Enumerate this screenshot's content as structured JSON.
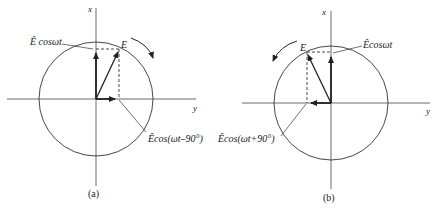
{
  "diagram_a": {
    "axis_x_label": "x",
    "axis_y_label": "y",
    "phasor_label": "E",
    "vertical_component_label": "Ê cosωt",
    "horizontal_component_label": "Êcos(ωt–90°)",
    "rotation": "clockwise",
    "caption": "(a)"
  },
  "diagram_b": {
    "axis_x_label": "x",
    "axis_y_label": "y",
    "phasor_label": "E",
    "vertical_component_label": "Êcosωt",
    "horizontal_component_label": "Êcos(ωt+90°)",
    "rotation": "counterclockwise",
    "caption": "(b)"
  },
  "colors": {
    "line": "#222222",
    "background": "#ffffff"
  }
}
